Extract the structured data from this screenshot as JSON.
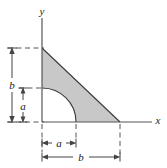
{
  "figure": {
    "type": "geometry-diagram",
    "background_color": "#ffffff",
    "shade_color": "#c8c8c8",
    "line_color": "#333333",
    "axes": {
      "y_label": "y",
      "x_label": "x",
      "origin_px": {
        "x": 42,
        "y": 122
      },
      "y_axis_top_px": 18,
      "x_axis_right_px": 152
    },
    "region": {
      "triangle_vertices_px": [
        {
          "x": 42,
          "y": 48
        },
        {
          "x": 42,
          "y": 122
        },
        {
          "x": 120,
          "y": 122
        }
      ],
      "arc": {
        "center_px": {
          "x": 42,
          "y": 122
        },
        "radius_px": 34,
        "start_px": {
          "x": 42,
          "y": 88
        },
        "end_px": {
          "x": 76,
          "y": 122
        }
      }
    },
    "dimensions": [
      {
        "name": "vertical-b",
        "label": "b",
        "orientation": "vertical",
        "from_px": {
          "x": 12,
          "y": 48
        },
        "to_px": {
          "x": 12,
          "y": 122
        },
        "label_px": {
          "x": 12,
          "y": 85
        }
      },
      {
        "name": "vertical-a",
        "label": "a",
        "orientation": "vertical",
        "from_px": {
          "x": 23,
          "y": 88
        },
        "to_px": {
          "x": 23,
          "y": 122
        },
        "label_px": {
          "x": 23,
          "y": 106
        }
      },
      {
        "name": "horizontal-a",
        "label": "a",
        "orientation": "horizontal",
        "from_px": {
          "x": 42,
          "y": 143
        },
        "to_px": {
          "x": 76,
          "y": 143
        },
        "label_px": {
          "x": 59,
          "y": 143
        }
      },
      {
        "name": "horizontal-b",
        "label": "b",
        "orientation": "horizontal",
        "from_px": {
          "x": 42,
          "y": 157
        },
        "to_px": {
          "x": 120,
          "y": 157
        },
        "label_px": {
          "x": 81,
          "y": 157
        }
      }
    ],
    "extension_lines": [
      {
        "name": "top-b-extension",
        "y_px": 48,
        "from_x_px": 8,
        "to_x_px": 44
      },
      {
        "name": "arc-a-extension",
        "y_px": 88,
        "from_x_px": 19,
        "to_x_px": 44
      },
      {
        "name": "baseline-extension",
        "y_px": 122,
        "from_x_px": 8,
        "to_x_px": 44
      },
      {
        "name": "left-vertical-extension",
        "x_px": 42,
        "from_y_px": 122,
        "to_y_px": 152
      },
      {
        "name": "mid-vertical-extension",
        "x_px": 76,
        "from_y_px": 122,
        "to_y_px": 140
      },
      {
        "name": "right-vertical-extension",
        "x_px": 120,
        "from_y_px": 122,
        "to_y_px": 154
      }
    ]
  }
}
